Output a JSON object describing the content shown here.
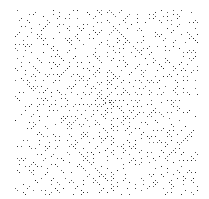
{
  "image": {
    "description": "Ulam-spiral-style prime dot pattern: dense field of black pixel dots on white with diagonal streaks",
    "width": 209,
    "height": 199,
    "background": "#ffffff",
    "dot_color": "#222222",
    "field": {
      "left": 14,
      "top": 9,
      "right": 198,
      "bottom": 195
    },
    "center": {
      "x": 107,
      "y": 100
    },
    "cell_size": 2
  }
}
